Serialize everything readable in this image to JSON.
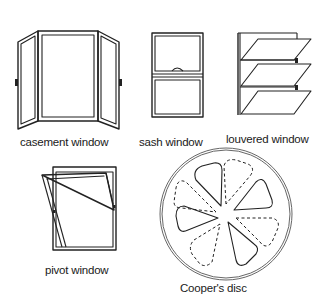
{
  "diagram": {
    "items": [
      {
        "id": "casement",
        "label": "casement window"
      },
      {
        "id": "sash",
        "label": "sash window"
      },
      {
        "id": "louvered",
        "label": "louvered window"
      },
      {
        "id": "pivot",
        "label": "pivot window"
      },
      {
        "id": "cooper",
        "label": "Cooper's disc"
      }
    ]
  },
  "colors": {
    "line": "#222222",
    "background": "#ffffff",
    "text": "#1a1a1a"
  }
}
